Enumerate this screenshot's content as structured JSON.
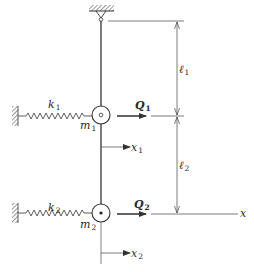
{
  "diagram": {
    "type": "double pendulum with springs",
    "colors": {
      "line": "#333333",
      "background": "#ffffff"
    },
    "labels": {
      "k1": {
        "main": "k",
        "sub": "1"
      },
      "k2": {
        "main": "k",
        "sub": "2"
      },
      "m1": {
        "main": "m",
        "sub": "1"
      },
      "m2": {
        "main": "m",
        "sub": "2"
      },
      "Q1": {
        "main": "Q",
        "sub": "1"
      },
      "Q2": {
        "main": "Q",
        "sub": "2"
      },
      "l1": {
        "main": "ℓ",
        "sub": "1"
      },
      "l2": {
        "main": "ℓ",
        "sub": "2"
      },
      "x1": {
        "main": "x",
        "sub": "1"
      },
      "x2": {
        "main": "x",
        "sub": "2"
      },
      "x_axis": "x"
    },
    "components": [
      "ceiling support with pivot",
      "upper rod (length ℓ1)",
      "mass m1 attached to wall by spring k1, force Q1",
      "lower rod (length ℓ2)",
      "mass m2 attached to wall by spring k2, force Q2",
      "horizontal displacement coordinates x1 and x2",
      "x axis"
    ]
  }
}
